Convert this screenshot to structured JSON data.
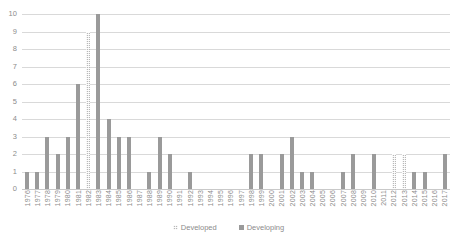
{
  "chart_data": {
    "type": "bar",
    "title": "",
    "subtitle": "",
    "xlabel": "",
    "ylabel": "",
    "ylim": [
      0,
      10
    ],
    "ytick_step": 1,
    "yticks": [
      "0",
      "1",
      "2",
      "3",
      "4",
      "5",
      "6",
      "7",
      "8",
      "9",
      "10"
    ],
    "grid": true,
    "legend_position": "bottom",
    "categories": [
      "1976",
      "1977",
      "1978",
      "1979",
      "1980",
      "1981",
      "1982",
      "1983",
      "1984",
      "1985",
      "1986",
      "1987",
      "1988",
      "1989",
      "1990",
      "1991",
      "1992",
      "1993",
      "1994",
      "1995",
      "1996",
      "1997",
      "1998",
      "1999",
      "2000",
      "2001",
      "2002",
      "2003",
      "2004",
      "2005",
      "2006",
      "2007",
      "2008",
      "2009",
      "2010",
      "2011",
      "2012",
      "2013",
      "2014",
      "2015",
      "2016",
      "2017"
    ],
    "series": [
      {
        "name": "Developed",
        "color": "#b8b8b8",
        "pattern": "hatched",
        "values": [
          0,
          0,
          0,
          0,
          0,
          0,
          9,
          0,
          0,
          0,
          0,
          0,
          0,
          0,
          0,
          0,
          0,
          0,
          0,
          0,
          0,
          0,
          0,
          0,
          0,
          0,
          0,
          0,
          0,
          0,
          0,
          0,
          0,
          0,
          0,
          0,
          2,
          2,
          0,
          0,
          0,
          0
        ]
      },
      {
        "name": "Developing",
        "color": "#9a9a9a",
        "pattern": "solid",
        "values": [
          1,
          1,
          3,
          2,
          3,
          6,
          0,
          10,
          4,
          3,
          3,
          0,
          1,
          3,
          2,
          0,
          1,
          0,
          0,
          0,
          0,
          0,
          2,
          2,
          0,
          2,
          3,
          1,
          1,
          0,
          0,
          1,
          2,
          0,
          2,
          0,
          0,
          0,
          1,
          1,
          0,
          2
        ]
      }
    ]
  },
  "legend": {
    "items": [
      {
        "label": "Developed"
      },
      {
        "label": "Developing"
      }
    ]
  }
}
